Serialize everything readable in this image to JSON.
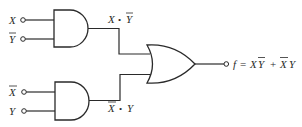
{
  "diagram": {
    "type": "logic-circuit",
    "colors": {
      "ink": "#2a2a2a",
      "background": "#ffffff"
    },
    "inputs": [
      {
        "id": "x1",
        "label": "X",
        "negated": false
      },
      {
        "id": "ybar1",
        "label": "Y",
        "negated": true
      },
      {
        "id": "xbar2",
        "label": "X",
        "negated": true
      },
      {
        "id": "y2",
        "label": "Y",
        "negated": false
      }
    ],
    "gates": [
      {
        "id": "and-top",
        "type": "AND",
        "inputs": [
          "X",
          "Y̅"
        ],
        "output_label": "X • Y̅"
      },
      {
        "id": "and-bottom",
        "type": "AND",
        "inputs": [
          "X̅",
          "Y"
        ],
        "output_label": "X̅ • Y"
      },
      {
        "id": "or-out",
        "type": "OR",
        "inputs": [
          "X • Y̅",
          "X̅ • Y"
        ]
      }
    ],
    "labels": {
      "top_product": {
        "left": "X",
        "dot": "•",
        "right": "Y"
      },
      "bottom_product": {
        "left": "X",
        "dot": "•",
        "right": "Y"
      },
      "output": {
        "f": "f",
        "eq": "=",
        "t1a": "X",
        "t1b": "Y",
        "plus": "+",
        "t2a": "X",
        "t2b": "Y"
      }
    },
    "output_expression": "f = XY̅ + X̅Y"
  }
}
